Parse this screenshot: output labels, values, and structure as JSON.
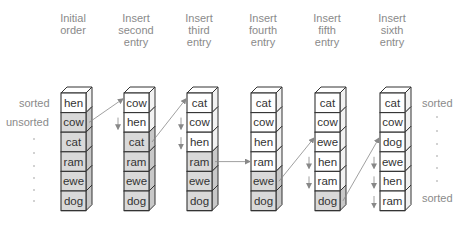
{
  "figure": {
    "colors": {
      "sorted_fill": "#ffffff",
      "unsorted_fill": "#d9d9d9",
      "outline": "#333333",
      "label": "#8a8a8a",
      "arrow": "#888888"
    },
    "columns": [
      {
        "header": [
          "Initial",
          "order"
        ],
        "cells": [
          "hen",
          "cow",
          "cat",
          "ram",
          "ewe",
          "dog"
        ],
        "sorted_count": 1
      },
      {
        "header": [
          "Insert",
          "second",
          "entry"
        ],
        "cells": [
          "cow",
          "hen",
          "cat",
          "ram",
          "ewe",
          "dog"
        ],
        "sorted_count": 2
      },
      {
        "header": [
          "Insert",
          "third",
          "entry"
        ],
        "cells": [
          "cat",
          "cow",
          "hen",
          "ram",
          "ewe",
          "dog"
        ],
        "sorted_count": 3
      },
      {
        "header": [
          "Insert",
          "fourth",
          "entry"
        ],
        "cells": [
          "cat",
          "cow",
          "hen",
          "ram",
          "ewe",
          "dog"
        ],
        "sorted_count": 4
      },
      {
        "header": [
          "Insert",
          "fifth",
          "entry"
        ],
        "cells": [
          "cat",
          "cow",
          "ewe",
          "hen",
          "ram",
          "dog"
        ],
        "sorted_count": 5
      },
      {
        "header": [
          "Insert",
          "sixth",
          "entry"
        ],
        "cells": [
          "cat",
          "cow",
          "dog",
          "ewe",
          "hen",
          "ram"
        ],
        "sorted_count": 6
      }
    ],
    "left_labels": {
      "sorted": "sorted",
      "unsorted": "unsorted"
    },
    "right_labels": {
      "top": "sorted",
      "bottom": "sorted"
    },
    "insert_arrows": [
      {
        "from_col": 0,
        "from_row": 1,
        "to_col": 1,
        "to_row": 0,
        "shift_rows": [
          1
        ]
      },
      {
        "from_col": 1,
        "from_row": 2,
        "to_col": 2,
        "to_row": 0,
        "shift_rows": [
          1,
          2
        ]
      },
      {
        "from_col": 2,
        "from_row": 3,
        "to_col": 3,
        "to_row": 3,
        "shift_rows": []
      },
      {
        "from_col": 3,
        "from_row": 4,
        "to_col": 4,
        "to_row": 2,
        "shift_rows": [
          3,
          4
        ]
      },
      {
        "from_col": 4,
        "from_row": 5,
        "to_col": 5,
        "to_row": 2,
        "shift_rows": [
          3,
          4,
          5
        ]
      }
    ]
  }
}
